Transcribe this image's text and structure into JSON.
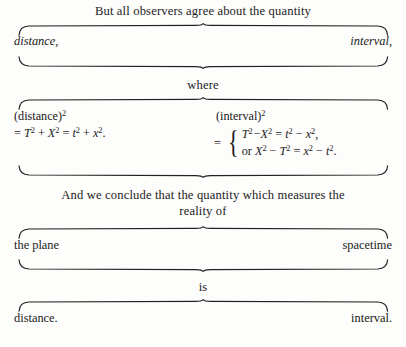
{
  "figure": {
    "title_caption": "But all observers agree about the quantity",
    "rows": [
      {
        "name": "quantity-terms",
        "left": "distance,",
        "right": "interval,",
        "style": "italic"
      },
      {
        "name": "plane-spacetime-terms",
        "left": "the plane",
        "right": "spacetime",
        "style": "roman"
      },
      {
        "name": "conclusion-terms",
        "left": "distance.",
        "right": "interval.",
        "style": "roman"
      }
    ],
    "captions": {
      "where": "where",
      "conclude_line1": "And we conclude that the quantity which measures the",
      "conclude_line2": "reality of",
      "is": "is"
    },
    "equations": {
      "left": {
        "label_text": "(distance)",
        "label_exp": "2",
        "line2": {
          "eq": "=",
          "terms": [
            {
              "base": "T",
              "exp": "2",
              "italic": true
            },
            {
              "op": "+"
            },
            {
              "base": "X",
              "exp": "2",
              "italic": true
            },
            {
              "op": "="
            },
            {
              "base": "t",
              "exp": "2",
              "italic": true
            },
            {
              "op": "+"
            },
            {
              "base": "x",
              "exp": "2",
              "italic": true
            }
          ],
          "plain": "= T2 + X2 = t2 + x2.",
          "terminator": "."
        }
      },
      "right": {
        "label_text": "(interval)",
        "label_exp": "2",
        "eq": "=",
        "brace": "{",
        "cases": [
          "T2 −X2 = t2 − x2,",
          "or X2 − T2 = x2 − t2."
        ]
      }
    },
    "colors": {
      "background": "#fdfdfb",
      "ink": "#1a1a1a",
      "brace_stroke": "#222222"
    }
  }
}
